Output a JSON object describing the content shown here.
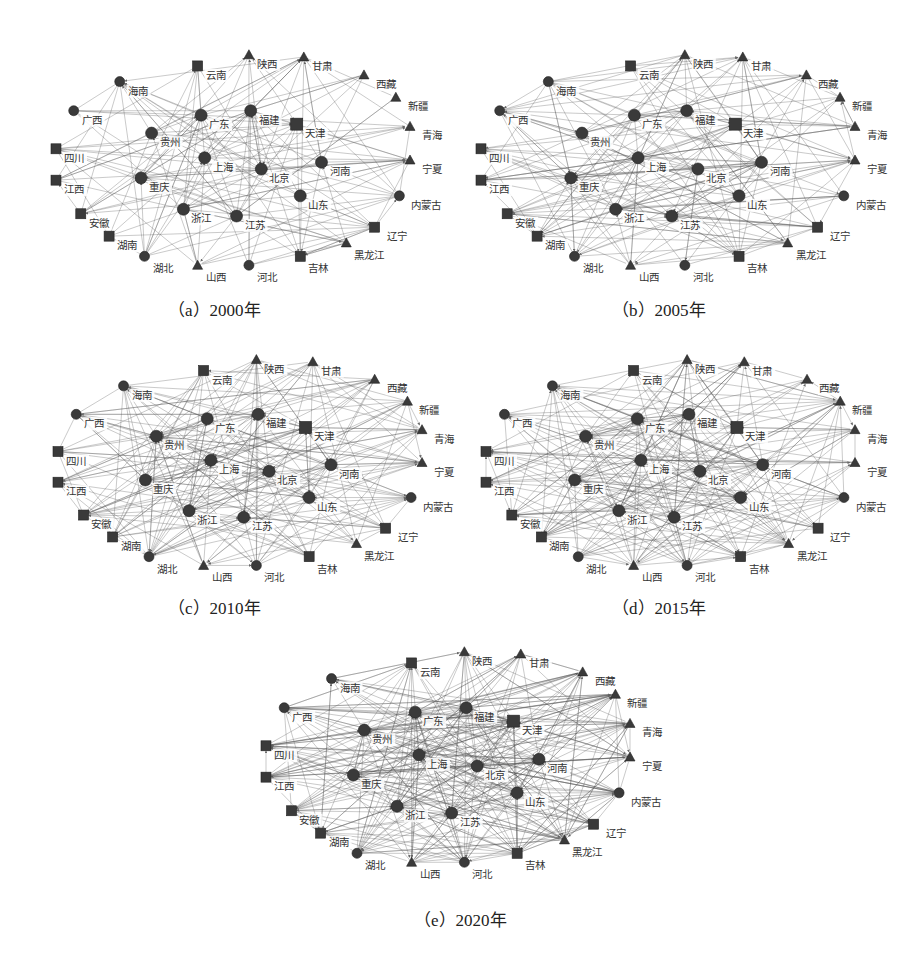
{
  "figure": {
    "panels": [
      {
        "id": "a",
        "caption": "（a）2000年",
        "year": 2000,
        "box": {
          "x": 48,
          "y": 40,
          "w": 370,
          "h": 240
        },
        "caption_pos": {
          "x": 168,
          "y": 296
        },
        "edge_density": 0.32
      },
      {
        "id": "b",
        "caption": "（b）2005年",
        "year": 2005,
        "box": {
          "x": 473,
          "y": 40,
          "w": 390,
          "h": 240
        },
        "caption_pos": {
          "x": 612,
          "y": 296
        },
        "edge_density": 0.42
      },
      {
        "id": "c",
        "caption": "（c）2010年",
        "year": 2010,
        "box": {
          "x": 50,
          "y": 345,
          "w": 380,
          "h": 235
        },
        "caption_pos": {
          "x": 168,
          "y": 594
        },
        "edge_density": 0.5
      },
      {
        "id": "d",
        "caption": "（d）2015年",
        "year": 2015,
        "box": {
          "x": 478,
          "y": 345,
          "w": 385,
          "h": 235
        },
        "caption_pos": {
          "x": 612,
          "y": 594
        },
        "edge_density": 0.58
      },
      {
        "id": "e",
        "caption": "（e）2020年",
        "year": 2020,
        "box": {
          "x": 258,
          "y": 637,
          "w": 380,
          "h": 240
        },
        "caption_pos": {
          "x": 414,
          "y": 906
        },
        "edge_density": 0.66
      }
    ]
  },
  "chart_data": {
    "type": "network",
    "title": "",
    "layout": "ellipse with inner core nodes",
    "node_shapes": "squares, circles, triangles (dark grey)",
    "edges": "directed grey lines with arrowheads",
    "nodes": [
      {
        "name": "云南",
        "x": 0.4,
        "y": 0.08,
        "shape": "square"
      },
      {
        "name": "陕西",
        "x": 0.545,
        "y": 0.03,
        "shape": "triangle"
      },
      {
        "name": "甘肃",
        "x": 0.7,
        "y": 0.04,
        "shape": "triangle"
      },
      {
        "name": "西藏",
        "x": 0.87,
        "y": 0.12,
        "shape": "triangle"
      },
      {
        "name": "新疆",
        "x": 0.96,
        "y": 0.22,
        "shape": "triangle"
      },
      {
        "name": "青海",
        "x": 1.0,
        "y": 0.35,
        "shape": "triangle"
      },
      {
        "name": "宁夏",
        "x": 1.0,
        "y": 0.5,
        "shape": "triangle"
      },
      {
        "name": "内蒙古",
        "x": 0.97,
        "y": 0.66,
        "shape": "circle"
      },
      {
        "name": "辽宁",
        "x": 0.9,
        "y": 0.8,
        "shape": "square"
      },
      {
        "name": "黑龙江",
        "x": 0.82,
        "y": 0.87,
        "shape": "triangle"
      },
      {
        "name": "吉林",
        "x": 0.69,
        "y": 0.93,
        "shape": "square"
      },
      {
        "name": "河北",
        "x": 0.545,
        "y": 0.97,
        "shape": "circle"
      },
      {
        "name": "山西",
        "x": 0.4,
        "y": 0.97,
        "shape": "triangle"
      },
      {
        "name": "湖北",
        "x": 0.25,
        "y": 0.93,
        "shape": "circle"
      },
      {
        "name": "湖南",
        "x": 0.15,
        "y": 0.84,
        "shape": "square"
      },
      {
        "name": "安徽",
        "x": 0.07,
        "y": 0.74,
        "shape": "square"
      },
      {
        "name": "江西",
        "x": 0.0,
        "y": 0.59,
        "shape": "square"
      },
      {
        "name": "四川",
        "x": 0.0,
        "y": 0.45,
        "shape": "square"
      },
      {
        "name": "广西",
        "x": 0.05,
        "y": 0.28,
        "shape": "circle"
      },
      {
        "name": "海南",
        "x": 0.18,
        "y": 0.15,
        "shape": "circle"
      },
      {
        "name": "广东",
        "x": 0.41,
        "y": 0.3,
        "shape": "circle"
      },
      {
        "name": "福建",
        "x": 0.55,
        "y": 0.28,
        "shape": "circle"
      },
      {
        "name": "天津",
        "x": 0.68,
        "y": 0.34,
        "shape": "square"
      },
      {
        "name": "贵州",
        "x": 0.27,
        "y": 0.38,
        "shape": "circle"
      },
      {
        "name": "上海",
        "x": 0.42,
        "y": 0.49,
        "shape": "circle"
      },
      {
        "name": "北京",
        "x": 0.58,
        "y": 0.54,
        "shape": "circle"
      },
      {
        "name": "河南",
        "x": 0.75,
        "y": 0.51,
        "shape": "circle"
      },
      {
        "name": "重庆",
        "x": 0.24,
        "y": 0.58,
        "shape": "circle"
      },
      {
        "name": "山东",
        "x": 0.69,
        "y": 0.66,
        "shape": "circle"
      },
      {
        "name": "浙江",
        "x": 0.36,
        "y": 0.72,
        "shape": "circle"
      },
      {
        "name": "江苏",
        "x": 0.51,
        "y": 0.75,
        "shape": "circle"
      }
    ],
    "hub_nodes": [
      "北京",
      "上海",
      "广东",
      "江苏",
      "浙江",
      "山东",
      "福建",
      "天津",
      "河南",
      "贵州",
      "重庆"
    ],
    "panel_years": [
      2000,
      2005,
      2010,
      2015,
      2020
    ],
    "trend": "edge density increases from 2000 to 2020"
  }
}
